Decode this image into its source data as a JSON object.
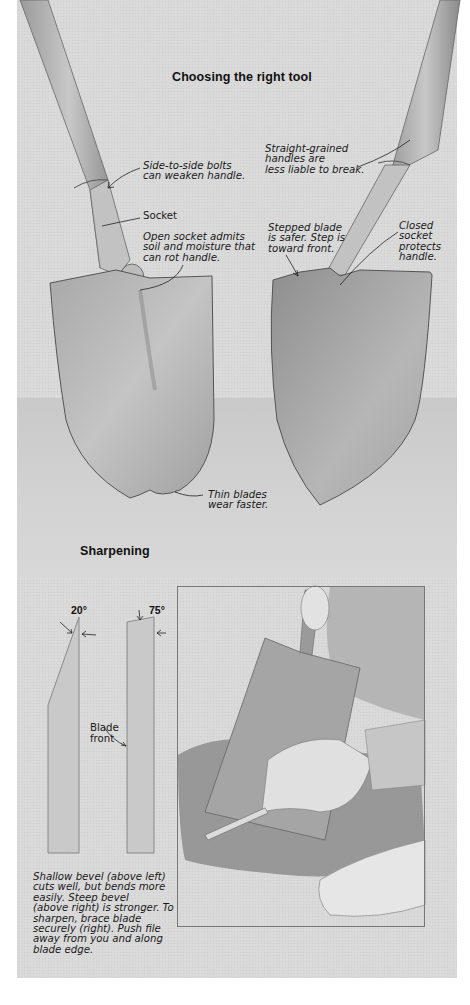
{
  "section_top": {
    "title": "Choosing the right tool",
    "annotations": {
      "side_bolts": "Side-to-side bolts\ncan weaken handle.",
      "socket": "Socket",
      "open_socket": "Open socket admits\nsoil and moisture that\ncan rot handle.",
      "straight_grained": "Straight-grained\nhandles are\nless liable to break.",
      "stepped_blade": "Stepped blade\nis safer. Step is\ntoward front.",
      "closed_socket": "Closed\nsocket\nprotects\nhandle.",
      "thin_blades": "Thin blades\nwear faster."
    }
  },
  "section_bottom": {
    "title": "Sharpening",
    "diagram": {
      "shallow_angle": "20°",
      "steep_angle": "75°",
      "blade_front": "Blade\nfront"
    },
    "caption": "Shallow bevel (above left)\ncuts well, but bends more\neasily. Steep bevel\n(above right) is stronger. To\nsharpen, brace blade\nsecurely (right). Push file\naway from you and along\nblade edge."
  }
}
